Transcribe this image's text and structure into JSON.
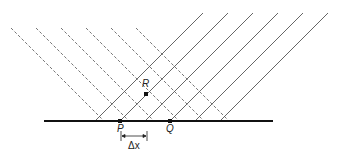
{
  "diagram": {
    "title": "",
    "labels": {
      "P": "P",
      "Q": "Q",
      "R": "R",
      "delta_x": "Δx"
    },
    "points": {
      "P": {
        "x": 120,
        "y": 121
      },
      "Q": {
        "x": 170,
        "y": 121
      },
      "R": {
        "x": 146,
        "y": 94
      }
    },
    "baseline": {
      "x1": 44,
      "x2": 273,
      "y": 121
    },
    "dashed_lines_start_x": [
      11,
      36,
      61,
      86,
      111,
      136
    ],
    "solid_lines_start_x": [
      203,
      228,
      253,
      278,
      303,
      328
    ],
    "colors": {
      "line": "#555555",
      "baseline": "#111111",
      "point": "#111111"
    }
  }
}
